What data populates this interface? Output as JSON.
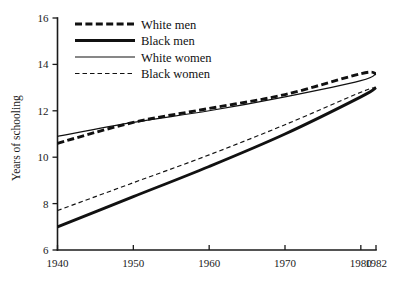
{
  "chart_data": {
    "type": "line",
    "title": "",
    "subtitle": "",
    "xlabel": "",
    "ylabel": "Years of schooling",
    "xlim": [
      1940,
      1982
    ],
    "ylim": [
      6,
      16
    ],
    "grid": false,
    "legend_position": "top-left",
    "x_ticks": [
      "1940",
      "1950",
      "1960",
      "1970",
      "1980",
      "1982"
    ],
    "x_tick_values": [
      1940,
      1950,
      1960,
      1970,
      1980,
      1982
    ],
    "y_ticks": [
      "6",
      "8",
      "10",
      "12",
      "14",
      "16"
    ],
    "y_tick_values": [
      6,
      8,
      10,
      12,
      14,
      16
    ],
    "x": [
      1940,
      1950,
      1960,
      1970,
      1980,
      1982
    ],
    "series": [
      {
        "name": "White men",
        "style": "thick-dashed",
        "color": "#111111",
        "values": [
          10.6,
          11.5,
          12.1,
          12.7,
          13.6,
          13.6
        ]
      },
      {
        "name": "Black men",
        "style": "thick-solid",
        "color": "#111111",
        "values": [
          7.0,
          8.3,
          9.6,
          11.0,
          12.6,
          13.0
        ]
      },
      {
        "name": "White women",
        "style": "thin-solid",
        "color": "#111111",
        "values": [
          10.9,
          11.5,
          12.0,
          12.6,
          13.3,
          13.6
        ]
      },
      {
        "name": "Black women",
        "style": "thin-dashed",
        "color": "#111111",
        "values": [
          7.7,
          8.9,
          10.1,
          11.4,
          12.8,
          13.0
        ]
      }
    ]
  },
  "legend": {
    "items": [
      {
        "label": "White men"
      },
      {
        "label": "Black men"
      },
      {
        "label": "White women"
      },
      {
        "label": "Black women"
      }
    ]
  },
  "axes": {
    "y_axis_label": "Years of schooling"
  }
}
